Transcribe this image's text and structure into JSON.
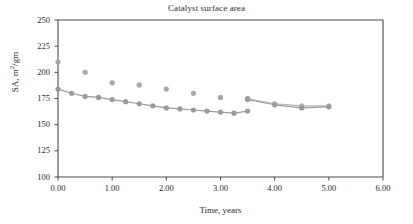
{
  "chart_data": {
    "type": "scatter",
    "title": "Catalyst surface area",
    "xlabel": "Time, years",
    "ylabel": "SA, m2/gm",
    "ylabel_parts": {
      "prefix": "SA, m",
      "sup": "2",
      "suffix": "/gm"
    },
    "xlim": [
      0.0,
      6.0
    ],
    "ylim": [
      100,
      250
    ],
    "xticks": [
      0.0,
      1.0,
      2.0,
      3.0,
      4.0,
      5.0,
      6.0
    ],
    "xtick_labels": [
      "0.00",
      "1.00",
      "2.00",
      "3.00",
      "4.00",
      "5.00",
      "6.00"
    ],
    "yticks": [
      100,
      125,
      150,
      175,
      200,
      225,
      250
    ],
    "ytick_labels": [
      "100",
      "125",
      "150",
      "175",
      "200",
      "225",
      "250"
    ],
    "grid": false,
    "legend": "none",
    "series": [
      {
        "name": "measured-scatter",
        "kind": "scatter",
        "color": "#a8a8a8",
        "marker": "circle",
        "points": [
          {
            "x": 0.0,
            "y": 210
          },
          {
            "x": 0.5,
            "y": 200
          },
          {
            "x": 1.0,
            "y": 190
          },
          {
            "x": 1.5,
            "y": 188
          },
          {
            "x": 2.0,
            "y": 184
          },
          {
            "x": 2.5,
            "y": 180
          },
          {
            "x": 3.0,
            "y": 176
          },
          {
            "x": 3.5,
            "y": 175
          }
        ]
      },
      {
        "name": "model-line-a",
        "kind": "line",
        "color": "#9a9a9a",
        "marker": "circle",
        "points": [
          {
            "x": 0.0,
            "y": 184
          },
          {
            "x": 0.25,
            "y": 180
          },
          {
            "x": 0.5,
            "y": 177
          },
          {
            "x": 0.75,
            "y": 176
          },
          {
            "x": 1.0,
            "y": 174
          },
          {
            "x": 1.25,
            "y": 172
          },
          {
            "x": 1.5,
            "y": 170
          },
          {
            "x": 1.75,
            "y": 168
          },
          {
            "x": 2.0,
            "y": 166
          },
          {
            "x": 2.25,
            "y": 165
          },
          {
            "x": 2.5,
            "y": 164
          },
          {
            "x": 2.75,
            "y": 163
          },
          {
            "x": 3.0,
            "y": 162
          },
          {
            "x": 3.25,
            "y": 161
          },
          {
            "x": 3.5,
            "y": 163
          }
        ]
      },
      {
        "name": "model-line-b",
        "kind": "line",
        "color": "#b4b4b4",
        "marker": "circle",
        "points": [
          {
            "x": 3.5,
            "y": 175
          },
          {
            "x": 4.0,
            "y": 170
          },
          {
            "x": 4.5,
            "y": 168
          },
          {
            "x": 5.0,
            "y": 168
          }
        ]
      },
      {
        "name": "model-line-c",
        "kind": "line",
        "color": "#9a9a9a",
        "marker": "circle",
        "points": [
          {
            "x": 3.5,
            "y": 174
          },
          {
            "x": 4.0,
            "y": 169
          },
          {
            "x": 4.5,
            "y": 166
          },
          {
            "x": 5.0,
            "y": 167
          }
        ]
      }
    ]
  },
  "axes": {
    "frame_color": "#4a4a4a",
    "tick_color": "#4a4a4a"
  }
}
